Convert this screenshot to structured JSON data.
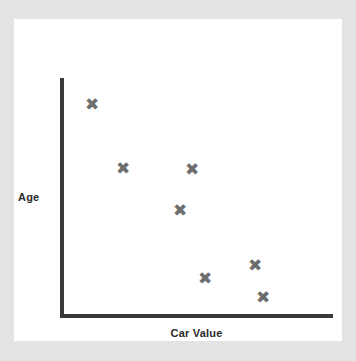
{
  "figure": {
    "background_color": "#e3e3e3",
    "panel_color": "#ffffff",
    "top_clipped_text": "",
    "axis_color": "#3a3a3a",
    "marker_color": "#6e6e6e",
    "label_color": "#2b2b2b",
    "marker_glyph": "✖",
    "marker_icon_name": "x-cross-marker-icon"
  },
  "chart_data": {
    "type": "scatter",
    "title": "",
    "xlabel": "Car Value",
    "ylabel": "Age",
    "xlim": [
      0,
      100
    ],
    "ylim": [
      0,
      100
    ],
    "grid": false,
    "legend": false,
    "axis_ticks": false,
    "axis_style": "L-shaped spine, no tick marks, no tick labels",
    "series": [
      {
        "name": "Cars",
        "marker": "x-cross",
        "color": "#6e6e6e",
        "points": [
          {
            "x": 12,
            "y": 89,
            "px": 92,
            "py": 104
          },
          {
            "x": 25,
            "y": 62,
            "px": 123,
            "py": 168
          },
          {
            "x": 48,
            "y": 61,
            "px": 192,
            "py": 169
          },
          {
            "x": 44,
            "y": 44,
            "px": 180,
            "py": 210
          },
          {
            "x": 53,
            "y": 15,
            "px": 205,
            "py": 278
          },
          {
            "x": 71,
            "y": 21,
            "px": 255,
            "py": 265
          },
          {
            "x": 74,
            "y": 7,
            "px": 263,
            "py": 297
          }
        ]
      }
    ],
    "relationship": "negative correlation between Car Value and Age"
  }
}
